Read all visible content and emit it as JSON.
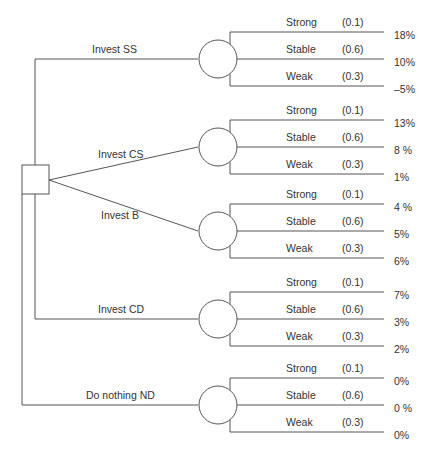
{
  "diagram": {
    "type": "decision-tree",
    "decision_node": "square",
    "alternatives": [
      {
        "label": "Invest SS",
        "outcomes": [
          {
            "state": "Strong",
            "prob": "(0.1)",
            "value": "18%"
          },
          {
            "state": "Stable",
            "prob": "(0.6)",
            "value": "10%"
          },
          {
            "state": "Weak",
            "prob": "(0.3)",
            "value": "–5%"
          }
        ]
      },
      {
        "label": "Invest CS",
        "outcomes": [
          {
            "state": "Strong",
            "prob": "(0.1)",
            "value": "13%"
          },
          {
            "state": "Stable",
            "prob": "(0.6)",
            "value": "8 %"
          },
          {
            "state": "Weak",
            "prob": "(0.3)",
            "value": "1%"
          }
        ]
      },
      {
        "label": "Invest B",
        "outcomes": [
          {
            "state": "Strong",
            "prob": "(0.1)",
            "value": "4 %"
          },
          {
            "state": "Stable",
            "prob": "(0.6)",
            "value": "5%"
          },
          {
            "state": "Weak",
            "prob": "(0.3)",
            "value": "6%"
          }
        ]
      },
      {
        "label": "Invest CD",
        "outcomes": [
          {
            "state": "Strong",
            "prob": "(0.1)",
            "value": "7%"
          },
          {
            "state": "Stable",
            "prob": "(0.6)",
            "value": "3%"
          },
          {
            "state": "Weak",
            "prob": "(0.3)",
            "value": "2%"
          }
        ]
      },
      {
        "label": "Do nothing  ND",
        "outcomes": [
          {
            "state": "Strong",
            "prob": "(0.1)",
            "value": "0%"
          },
          {
            "state": "Stable",
            "prob": "(0.6)",
            "value": "0 %"
          },
          {
            "state": "Weak",
            "prob": "(0.3)",
            "value": "0%"
          }
        ]
      }
    ]
  },
  "caption": "",
  "colors": {
    "line": "#555555",
    "text": "#333333",
    "background": "#ffffff"
  }
}
